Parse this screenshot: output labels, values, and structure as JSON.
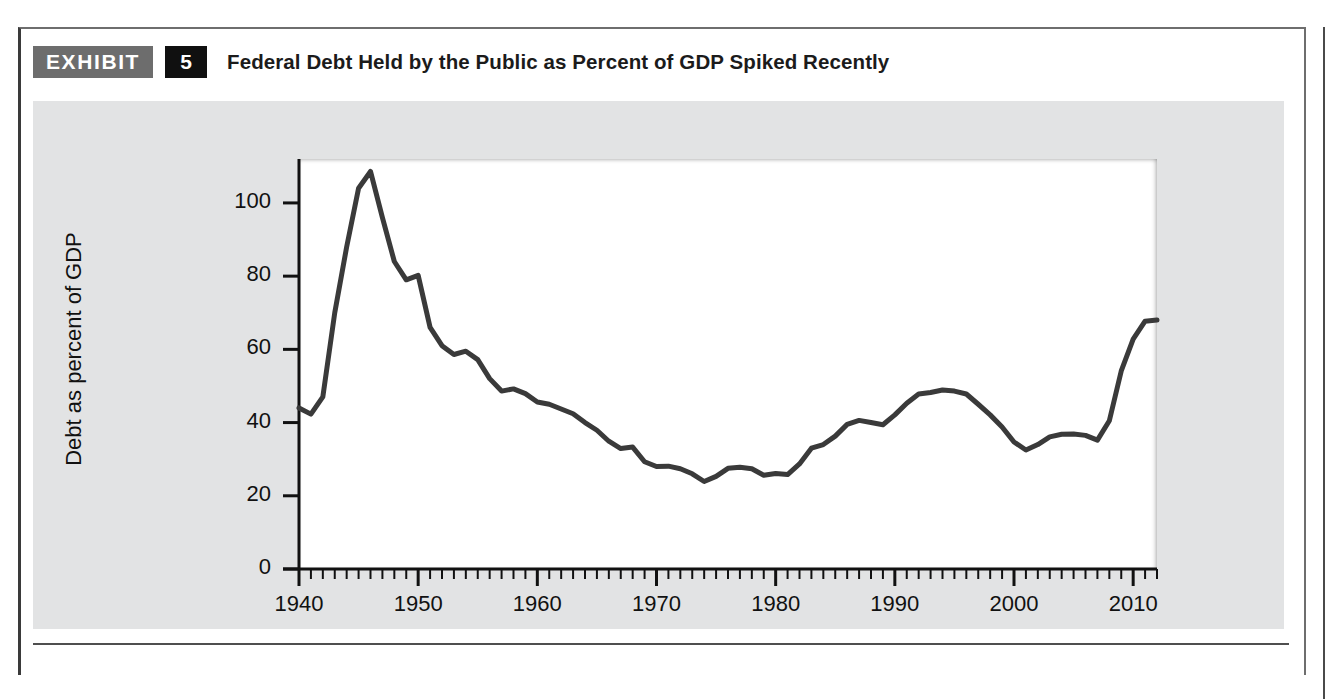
{
  "exhibit": {
    "badge_label": "EXHIBIT",
    "number": "5",
    "title": "Federal Debt Held by the Public as Percent of GDP Spiked Recently"
  },
  "colors": {
    "badge_gray": "#6d6d6d",
    "badge_black": "#101010",
    "panel_gray": "#e2e3e4",
    "line": "#3a3a3a",
    "axis": "#111111",
    "plot_background": "#ffffff"
  },
  "chart_data": {
    "type": "line",
    "title": "Federal Debt Held by the Public as Percent of GDP Spiked Recently",
    "xlabel": "",
    "ylabel": "Debt as percent of GDP",
    "xlim": [
      1940,
      2012
    ],
    "ylim": [
      0,
      112
    ],
    "grid": false,
    "legend": null,
    "y_ticks": [
      0,
      20,
      40,
      60,
      80,
      100
    ],
    "y_tick_labels": [
      "0",
      "20",
      "40",
      "60",
      "80",
      "100"
    ],
    "x_ticks": [
      1940,
      1950,
      1960,
      1970,
      1980,
      1990,
      2000,
      2010
    ],
    "x_tick_labels": [
      "1940",
      "1950",
      "1960",
      "1970",
      "1980",
      "1990",
      "2000",
      "2010"
    ],
    "x_minor_tick_interval": 1,
    "series": [
      {
        "name": "Debt as percent of GDP",
        "x": [
          1940,
          1941,
          1942,
          1943,
          1944,
          1945,
          1946,
          1947,
          1948,
          1949,
          1950,
          1951,
          1952,
          1953,
          1954,
          1955,
          1956,
          1957,
          1958,
          1959,
          1960,
          1961,
          1962,
          1963,
          1964,
          1965,
          1966,
          1967,
          1968,
          1969,
          1970,
          1971,
          1972,
          1973,
          1974,
          1975,
          1976,
          1977,
          1978,
          1979,
          1980,
          1981,
          1982,
          1983,
          1984,
          1985,
          1986,
          1987,
          1988,
          1989,
          1990,
          1991,
          1992,
          1993,
          1994,
          1995,
          1996,
          1997,
          1998,
          1999,
          2000,
          2001,
          2002,
          2003,
          2004,
          2005,
          2006,
          2007,
          2008,
          2009,
          2010,
          2011,
          2012
        ],
        "y": [
          44.0,
          42.3,
          47.0,
          70.0,
          88.0,
          104.0,
          108.6,
          96.0,
          84.0,
          79.0,
          80.2,
          66.0,
          61.0,
          58.6,
          59.5,
          57.2,
          52.0,
          48.6,
          49.2,
          47.9,
          45.6,
          45.0,
          43.7,
          42.4,
          40.0,
          37.9,
          34.9,
          32.9,
          33.3,
          29.3,
          28.0,
          28.1,
          27.4,
          26.0,
          23.9,
          25.3,
          27.5,
          27.8,
          27.4,
          25.6,
          26.1,
          25.8,
          28.7,
          33.0,
          34.0,
          36.3,
          39.5,
          40.6,
          40.0,
          39.4,
          42.1,
          45.3,
          47.8,
          48.2,
          48.9,
          48.6,
          47.8,
          45.0,
          42.1,
          38.8,
          34.7,
          32.5,
          34.0,
          36.1,
          36.8,
          36.9,
          36.5,
          35.2,
          40.5,
          54.1,
          62.8,
          67.7,
          68.0
        ],
        "peak": {
          "year": 1946,
          "value": 108.6
        },
        "trough": {
          "year": 1974,
          "value": 23.9
        },
        "final": {
          "year": 2012,
          "value": 68.0
        }
      }
    ]
  }
}
